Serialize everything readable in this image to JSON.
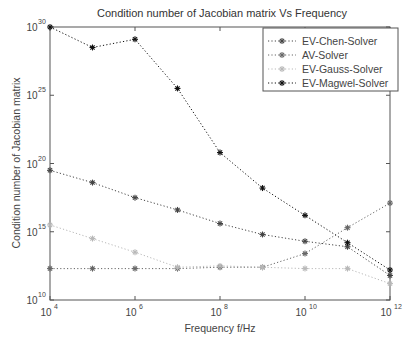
{
  "chart_data": {
    "type": "line",
    "title": "Condition number of Jacobian matrix  Vs Frequency",
    "xlabel": "Frequency f/Hz",
    "ylabel": "Condition number of Jacobian matrix",
    "xscale": "log",
    "yscale": "log",
    "xlim": [
      10000,
      1000000000000
    ],
    "ylim": [
      10000000000.0,
      1e+30
    ],
    "x_ticks": [
      {
        "base": "10",
        "exp": "4"
      },
      {
        "base": "10",
        "exp": "6"
      },
      {
        "base": "10",
        "exp": "8"
      },
      {
        "base": "10",
        "exp": "10"
      },
      {
        "base": "10",
        "exp": "12"
      }
    ],
    "y_ticks": [
      {
        "base": "10",
        "exp": "10"
      },
      {
        "base": "10",
        "exp": "15"
      },
      {
        "base": "10",
        "exp": "20"
      },
      {
        "base": "10",
        "exp": "25"
      },
      {
        "base": "10",
        "exp": "30"
      }
    ],
    "grid": false,
    "legend_position": "upper right",
    "x_log10": [
      4,
      5,
      6,
      7,
      8,
      9,
      10,
      11,
      12
    ],
    "series": [
      {
        "name": "EV-Chen-Solver",
        "color": "#444444",
        "marker": "*",
        "linestyle": "dotted",
        "log10_values": [
          19.5,
          18.6,
          17.5,
          16.6,
          15.6,
          14.8,
          14.3,
          13.9,
          11.8
        ]
      },
      {
        "name": "AV-Solver",
        "color": "#666666",
        "marker": "*",
        "linestyle": "dotted",
        "log10_values": [
          12.3,
          12.3,
          12.3,
          12.3,
          12.4,
          12.4,
          13.4,
          15.3,
          17.1
        ]
      },
      {
        "name": "EV-Gauss-Solver",
        "color": "#b8b8b8",
        "marker": "*",
        "linestyle": "dotted",
        "log10_values": [
          15.5,
          14.5,
          13.5,
          12.4,
          12.5,
          12.4,
          12.3,
          12.3,
          11.2
        ]
      },
      {
        "name": "EV-Magwel-Solver",
        "color": "#111111",
        "marker": "*",
        "linestyle": "dotted",
        "log10_values": [
          30.0,
          28.5,
          29.1,
          25.5,
          20.8,
          18.2,
          16.2,
          14.2,
          12.2
        ]
      }
    ]
  }
}
